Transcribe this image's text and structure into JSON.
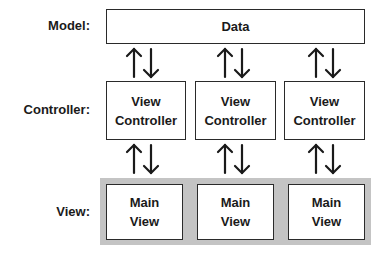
{
  "rows": {
    "model": {
      "label": "Model:"
    },
    "controller": {
      "label": "Controller:"
    },
    "view": {
      "label": "View:"
    }
  },
  "model_box": {
    "text": "Data"
  },
  "controllers": [
    {
      "line1": "View",
      "line2": "Controller"
    },
    {
      "line1": "View",
      "line2": "Controller"
    },
    {
      "line1": "View",
      "line2": "Controller"
    }
  ],
  "views": [
    {
      "line1": "Main",
      "line2": "View"
    },
    {
      "line1": "Main",
      "line2": "View"
    },
    {
      "line1": "Main",
      "line2": "View"
    }
  ],
  "arrow_glyphs": {
    "up": "up-arrow",
    "down": "down-arrow"
  },
  "colors": {
    "band": "#c4c4c4",
    "stroke": "#2a2a2a"
  }
}
